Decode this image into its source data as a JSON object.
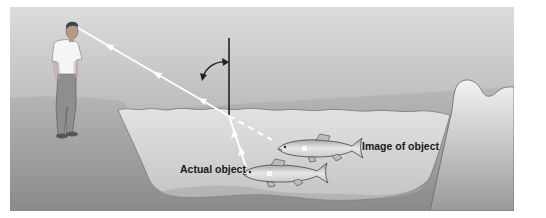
{
  "figure": {
    "labels": {
      "actual_object": "Actual object",
      "image_of_object": "Image of object"
    },
    "elements": {
      "observer": "person standing on shore",
      "incident_ray": "light ray from fish refracting at water surface to observer's eye",
      "normal": "vertical normal line at point of refraction",
      "angle_arc": "curved arrow indicating angle of refraction from normal",
      "dashed_line": "apparent line of sight extended to image of object",
      "fish_actual": "actual fish",
      "fish_image": "image of fish"
    },
    "colors": {
      "sky_top": "#d9d9d9",
      "sky_bottom": "#9a9a9a",
      "ground": "#8c8c8c",
      "water": "#cfcfcf",
      "ray": "#ffffff",
      "normal_line": "#222222"
    }
  }
}
